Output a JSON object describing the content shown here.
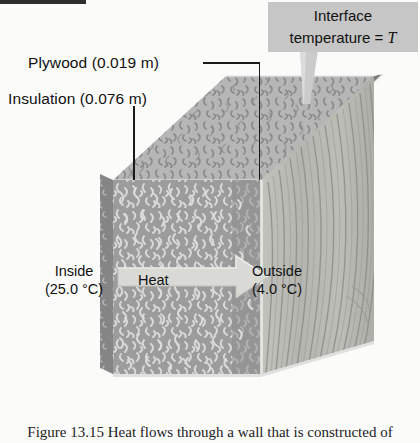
{
  "figure": {
    "kind": "physics-textbook-diagram",
    "labels": {
      "plywood": "Plywood (0.019 m)",
      "insulation": "Insulation (0.076 m)",
      "inside_title": "Inside",
      "inside_value": "(25.0 °C)",
      "outside_title": "Outside",
      "outside_value": "(4.0 °C)",
      "heat": "Heat"
    },
    "callout": {
      "line1": "Interface",
      "line2_prefix": "temperature = ",
      "line2_symbol": "T"
    },
    "caption": "Figure 13.15  Heat flows through a wall that is constructed of",
    "materials": {
      "insulation_thickness_m": 0.019,
      "plywood_thickness_m": 0.076,
      "inside_temperature_C": 25.0,
      "outside_temperature_C": 4.0
    },
    "colors": {
      "background": "#fbfbfa",
      "callout_fill": "#c6c6c6",
      "insulation_front": "#9a9a9a",
      "insulation_top": "#b4b4b4",
      "plywood_face": "#b9b9b6",
      "plywood_top_edge": "#8d8d8d",
      "heat_arrow": "#d6d6d4",
      "leader_line": "#1a1a1a",
      "text": "#111111"
    }
  }
}
